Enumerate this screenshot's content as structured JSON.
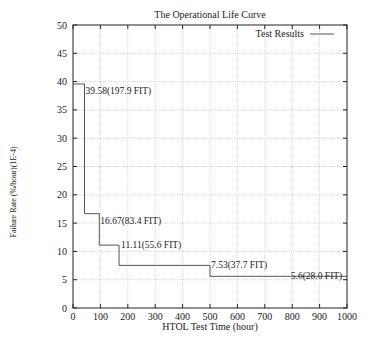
{
  "chart_data": {
    "type": "line",
    "subtype": "step",
    "title": "The Operational Life Curve",
    "xlabel": "HTOL Test Time (hour)",
    "ylabel": "Failure Rate (%/hour)(1E-4)",
    "xlim": [
      0,
      1000
    ],
    "ylim": [
      0,
      50
    ],
    "xticks": [
      0,
      100,
      200,
      300,
      400,
      500,
      600,
      700,
      800,
      900,
      1000
    ],
    "yticks": [
      0,
      5,
      10,
      15,
      20,
      25,
      30,
      35,
      40,
      45,
      50
    ],
    "grid": true,
    "legend": {
      "position": "top-right",
      "entries": [
        "Test Results"
      ]
    },
    "series": [
      {
        "name": "Test Results",
        "steps": [
          {
            "x_start": 0,
            "x_end": 42,
            "y": 39.58,
            "label": "39.58(197.9 FIT)"
          },
          {
            "x_start": 42,
            "x_end": 96,
            "y": 16.67,
            "label": "16.67(83.4 FIT)"
          },
          {
            "x_start": 96,
            "x_end": 168,
            "y": 11.11,
            "label": "11.11(55.6 FIT)"
          },
          {
            "x_start": 168,
            "x_end": 500,
            "y": 7.53,
            "label": "7.53(37.7 FIT)"
          },
          {
            "x_start": 500,
            "x_end": 1000,
            "y": 5.6,
            "label": "5.6(28.0 FIT)"
          }
        ]
      }
    ]
  },
  "colors": {
    "line": "#555555",
    "axis": "#222222",
    "grid": "#bbbbbb"
  }
}
